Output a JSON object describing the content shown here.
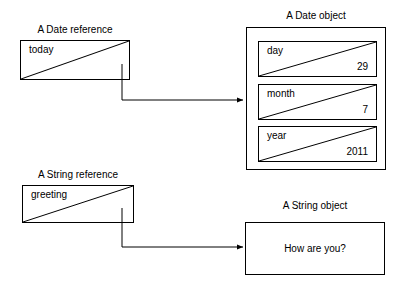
{
  "diagram": {
    "background": "#ffffff",
    "stroke_color": "#000000",
    "text_color": "#000000",
    "width": 407,
    "height": 289
  },
  "date_reference": {
    "caption": "A Date reference",
    "variable_name": "today",
    "value": ""
  },
  "date_object": {
    "caption": "A Date object",
    "fields": [
      {
        "name": "day",
        "value": "29"
      },
      {
        "name": "month",
        "value": "7"
      },
      {
        "name": "year",
        "value": "2011"
      }
    ]
  },
  "string_reference": {
    "caption": "A String reference",
    "variable_name": "greeting",
    "value": ""
  },
  "string_object": {
    "caption": "A String object",
    "content": "How are you?"
  },
  "connectors": [
    {
      "from": "date_reference",
      "to": "date_object",
      "style": "elbow-arrow"
    },
    {
      "from": "string_reference",
      "to": "string_object",
      "style": "elbow-arrow"
    }
  ]
}
